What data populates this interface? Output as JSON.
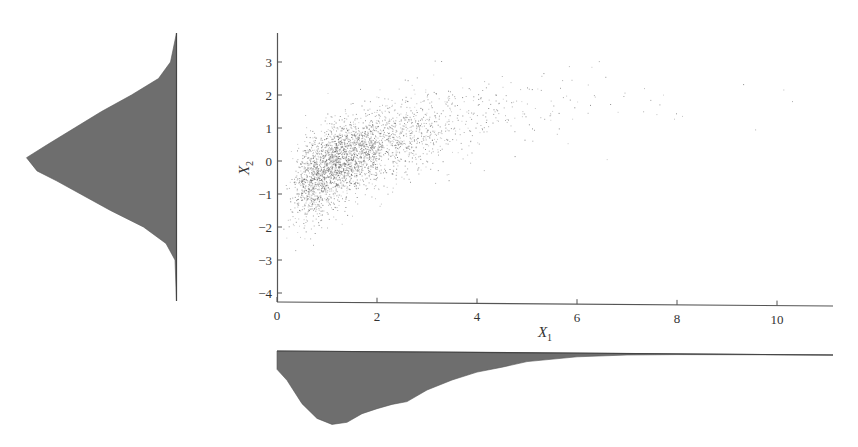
{
  "chart_data": {
    "type": "scatter",
    "title": "",
    "subtitle": "Scatter plot of X1 vs X2 with marginal density plots",
    "xlabel": "X1",
    "ylabel": "X2",
    "xlabel_main": "X",
    "xlabel_sub": "1",
    "ylabel_main": "X",
    "ylabel_sub": "2",
    "xlim": [
      0,
      11.1
    ],
    "ylim": [
      -4.3,
      3.9
    ],
    "x_ticks": [
      0,
      2,
      4,
      6,
      8,
      10
    ],
    "y_ticks": [
      3,
      2,
      1,
      0,
      -1,
      -2,
      -3,
      -4
    ],
    "grid": false,
    "legend": null,
    "point_color": "#555555",
    "density_fill": "#6e6e6e",
    "axis_color": "#555555",
    "scatter_model": {
      "description": "X1 ~ lognormal, X2 increases with log(X1); ~3000 points",
      "n_points": 3000,
      "x1_lognormal_mu": 0.35,
      "x1_lognormal_sigma": 0.6,
      "x2_intercept": -0.6,
      "x2_log_slope": 1.5,
      "x2_noise_sd": 0.6,
      "approx_centers": [
        {
          "x1": 0.5,
          "x2": -1.5
        },
        {
          "x1": 1.0,
          "x2": -0.6
        },
        {
          "x1": 2.0,
          "x2": 0.3
        },
        {
          "x1": 3.0,
          "x2": 0.8
        },
        {
          "x1": 4.0,
          "x2": 1.1
        },
        {
          "x1": 5.0,
          "x2": 1.4
        },
        {
          "x1": 6.0,
          "x2": 1.7
        }
      ]
    },
    "marginal_x2": {
      "orientation": "vertical-left",
      "description": "Roughly normal density of X2, peak near X2≈0.1",
      "y_values": [
        3.9,
        3.0,
        2.5,
        2.0,
        1.5,
        1.0,
        0.5,
        0.1,
        -0.3,
        -0.6,
        -1.0,
        -1.5,
        -2.0,
        -2.5,
        -3.0,
        -4.3
      ],
      "density_rel": [
        0.0,
        0.04,
        0.12,
        0.3,
        0.5,
        0.68,
        0.86,
        1.0,
        0.93,
        0.8,
        0.64,
        0.44,
        0.22,
        0.07,
        0.01,
        0.0
      ]
    },
    "marginal_x1": {
      "orientation": "horizontal-bottom",
      "description": "Right-skewed density of X1, peak near X1≈1.1",
      "x_values": [
        0,
        0.2,
        0.5,
        0.8,
        1.1,
        1.4,
        1.7,
        2.0,
        2.3,
        2.6,
        3.0,
        3.5,
        4.0,
        4.5,
        5.0,
        6.0,
        7.0,
        8.0,
        11.1
      ],
      "density_rel": [
        0.25,
        0.4,
        0.72,
        0.92,
        1.0,
        0.97,
        0.85,
        0.78,
        0.72,
        0.68,
        0.52,
        0.38,
        0.27,
        0.2,
        0.12,
        0.05,
        0.02,
        0.01,
        0.0
      ]
    }
  },
  "labels": {
    "x_ticks": [
      "0",
      "2",
      "4",
      "6",
      "8",
      "10"
    ],
    "y_ticks": [
      "3",
      "2",
      "1",
      "0",
      "−1",
      "−2",
      "−3",
      "−4"
    ],
    "xlabel_main": "X",
    "xlabel_sub": "1",
    "ylabel_main": "X",
    "ylabel_sub": "2"
  }
}
